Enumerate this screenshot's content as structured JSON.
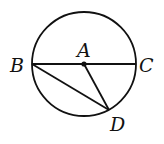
{
  "diagram": {
    "type": "geometry-circle",
    "colors": {
      "stroke": "#111111",
      "background": "#ffffff"
    },
    "circle": {
      "center": "A",
      "cx": 84,
      "cy": 64,
      "r": 52
    },
    "points": {
      "A": {
        "label": "A",
        "x": 84,
        "y": 64
      },
      "B": {
        "label": "B",
        "x": 32,
        "y": 64
      },
      "C": {
        "label": "C",
        "x": 136,
        "y": 64
      },
      "D": {
        "label": "D",
        "x": 109,
        "y": 110
      }
    },
    "segments": [
      {
        "from": "B",
        "to": "C",
        "name": "diameter-BC"
      },
      {
        "from": "B",
        "to": "D",
        "name": "chord-BD"
      },
      {
        "from": "A",
        "to": "D",
        "name": "radius-AD"
      }
    ]
  }
}
